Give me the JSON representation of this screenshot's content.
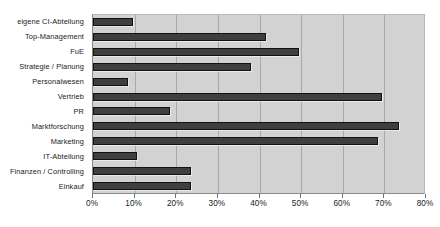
{
  "chart_data": {
    "type": "bar",
    "orientation": "horizontal",
    "title": "",
    "subtitle": "",
    "xlabel": "",
    "ylabel": "",
    "xlim": [
      0,
      80
    ],
    "xtick_labels": [
      "0%",
      "10%",
      "20%",
      "30%",
      "40%",
      "50%",
      "60%",
      "70%",
      "80%"
    ],
    "xtick_values": [
      0,
      10,
      20,
      30,
      40,
      50,
      60,
      70,
      80
    ],
    "grid": true,
    "legend": "none",
    "categories": [
      "eigene CI-Abteilung",
      "Top-Management",
      "FuE",
      "Strategie / Planung",
      "Personalwesen",
      "Vertrieb",
      "PR",
      "Marktforschung",
      "Marketing",
      "IT-Abteilung",
      "Finanzen / Controlling",
      "Einkauf"
    ],
    "values": [
      9.5,
      41.5,
      49.5,
      38.0,
      8.5,
      69.5,
      18.5,
      73.5,
      68.5,
      10.5,
      23.5,
      23.5
    ],
    "unit": "%",
    "colors": {
      "bar_fill": "#3f3f3f",
      "bar_border": "#111111",
      "plot_background": "#d2d2d2",
      "gridline": "#a9a9a9",
      "page_background": "#ffffff",
      "text": "#1a1a1a"
    }
  }
}
